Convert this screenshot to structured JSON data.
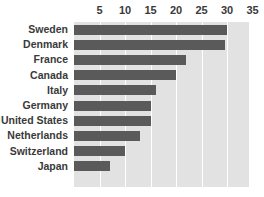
{
  "chart_data": {
    "type": "bar",
    "orientation": "horizontal",
    "title": "",
    "subtitle": "",
    "xlabel": "",
    "ylabel": "",
    "xlim": [
      0,
      34.3
    ],
    "grid": true,
    "legend": null,
    "axis_position": "top",
    "tick_labels": [
      "5",
      "10",
      "15",
      "20",
      "25",
      "30",
      "35"
    ],
    "ticks": [
      5,
      10,
      15,
      20,
      25,
      30,
      35
    ],
    "categories": [
      "Sweden",
      "Denmark",
      "France",
      "Canada",
      "Italy",
      "Germany",
      "United States",
      "Netherlands",
      "Switzerland",
      "Japan"
    ],
    "values": [
      30,
      29.5,
      22,
      20,
      16,
      15,
      15,
      13,
      10,
      7
    ],
    "colors": {
      "bar": "#5a5a5a",
      "plot_background": "#e2e2e2",
      "gridline": "#ffffff",
      "text": "#3a3a3a",
      "page_background": "#ffffff"
    }
  }
}
